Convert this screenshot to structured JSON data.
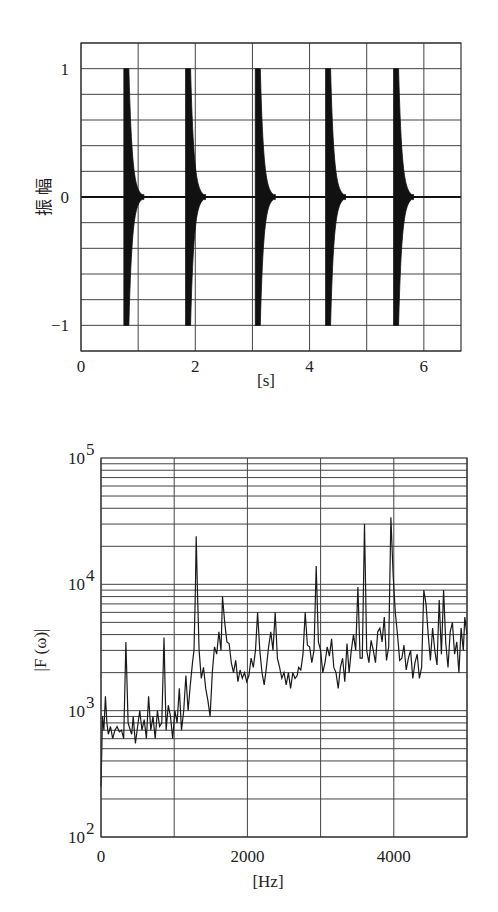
{
  "chart_data": [
    {
      "type": "line",
      "title": "",
      "xlabel": "[s]",
      "ylabel": "振 幅",
      "xlim": [
        0,
        6.65
      ],
      "ylim": [
        -1.2,
        1.2
      ],
      "xticks": [
        0,
        2,
        4,
        6
      ],
      "xtick_labels": [
        "0",
        "2",
        "4",
        "6"
      ],
      "yticks": [
        -1,
        0,
        1
      ],
      "ytick_labels": [
        "−1",
        "0",
        "1"
      ],
      "grid": {
        "x_step": 1,
        "y_step": 0.2
      },
      "description": "Five decaying impulse bursts, each peaking at amplitude ±1 and decaying to ~0 within ~0.35 s",
      "series": [
        {
          "name": "amplitude",
          "bursts": [
            {
              "onset": 0.75,
              "peak": 1.0,
              "decay_s": 0.35
            },
            {
              "onset": 1.83,
              "peak": 1.0,
              "decay_s": 0.35
            },
            {
              "onset": 3.05,
              "peak": 1.0,
              "decay_s": 0.35
            },
            {
              "onset": 4.28,
              "peak": 1.0,
              "decay_s": 0.35
            },
            {
              "onset": 5.47,
              "peak": 1.0,
              "decay_s": 0.35
            }
          ]
        }
      ]
    },
    {
      "type": "line",
      "title": "",
      "xlabel": "[Hz]",
      "ylabel": "|F (ω)|",
      "xlim": [
        0,
        5000
      ],
      "ylim": [
        100,
        100000
      ],
      "yscale": "log",
      "xticks": [
        0,
        2000,
        4000
      ],
      "xtick_labels": [
        "0",
        "2000",
        "4000"
      ],
      "yticks": [
        100,
        1000,
        10000,
        100000
      ],
      "ytick_labels": [
        {
          "base": "10",
          "exp": "2"
        },
        {
          "base": "10",
          "exp": "3"
        },
        {
          "base": "10",
          "exp": "4"
        },
        {
          "base": "10",
          "exp": "5"
        }
      ],
      "grid": {
        "x_step": 1000,
        "y": "log-minor"
      },
      "series": [
        {
          "name": "|F(ω)|",
          "x": [
            0,
            20,
            40,
            60,
            80,
            100,
            130,
            160,
            190,
            220,
            250,
            280,
            310,
            340,
            370,
            400,
            420,
            440,
            470,
            500,
            530,
            560,
            590,
            620,
            650,
            680,
            710,
            740,
            770,
            800,
            830,
            860,
            890,
            920,
            950,
            980,
            1010,
            1040,
            1070,
            1100,
            1130,
            1160,
            1190,
            1220,
            1250,
            1270,
            1290,
            1300,
            1320,
            1340,
            1370,
            1400,
            1430,
            1460,
            1490,
            1520,
            1550,
            1580,
            1610,
            1640,
            1660,
            1690,
            1720,
            1750,
            1780,
            1810,
            1840,
            1870,
            1900,
            1930,
            1960,
            1990,
            2020,
            2050,
            2080,
            2110,
            2140,
            2170,
            2200,
            2230,
            2260,
            2290,
            2320,
            2350,
            2380,
            2410,
            2440,
            2470,
            2500,
            2530,
            2560,
            2590,
            2620,
            2650,
            2680,
            2700,
            2730,
            2760,
            2790,
            2820,
            2850,
            2880,
            2910,
            2940,
            2970,
            3000,
            3030,
            3060,
            3090,
            3120,
            3150,
            3180,
            3210,
            3240,
            3270,
            3300,
            3330,
            3360,
            3390,
            3420,
            3450,
            3480,
            3510,
            3540,
            3570,
            3600,
            3630,
            3660,
            3690,
            3720,
            3750,
            3780,
            3810,
            3840,
            3870,
            3900,
            3930,
            3960,
            3990,
            4020,
            4050,
            4080,
            4110,
            4140,
            4170,
            4200,
            4230,
            4260,
            4290,
            4320,
            4350,
            4380,
            4410,
            4440,
            4470,
            4500,
            4530,
            4560,
            4590,
            4620,
            4650,
            4680,
            4710,
            4740,
            4770,
            4800,
            4830,
            4860,
            4890,
            4920,
            4950,
            4970,
            5000
          ],
          "y": [
            250,
            900,
            700,
            1300,
            800,
            650,
            750,
            600,
            700,
            750,
            680,
            700,
            600,
            3500,
            800,
            700,
            650,
            900,
            550,
            750,
            1000,
            700,
            850,
            600,
            1300,
            700,
            900,
            600,
            1000,
            750,
            800,
            3800,
            700,
            1100,
            900,
            600,
            1000,
            800,
            1500,
            700,
            1000,
            1900,
            1000,
            1600,
            2400,
            3000,
            9000,
            24000,
            8000,
            3000,
            1800,
            2200,
            1500,
            1200,
            900,
            2000,
            3200,
            2800,
            4200,
            3000,
            8000,
            5000,
            3500,
            3400,
            2400,
            2000,
            2500,
            1700,
            2100,
            1800,
            2000,
            1700,
            1900,
            2600,
            2200,
            3000,
            6000,
            3000,
            2000,
            1600,
            2200,
            3200,
            4200,
            3000,
            6000,
            2600,
            2200,
            1800,
            2000,
            1600,
            2000,
            1500,
            2000,
            1800,
            1900,
            2200,
            2100,
            2800,
            6000,
            3300,
            3200,
            2400,
            3000,
            14000,
            3500,
            3000,
            2000,
            2400,
            3200,
            2700,
            3700,
            2200,
            2000,
            1500,
            2200,
            2600,
            1700,
            3400,
            2000,
            3000,
            4000,
            3000,
            9500,
            2600,
            2600,
            30000,
            3000,
            2400,
            3600,
            3000,
            2400,
            4200,
            4500,
            3500,
            5500,
            2500,
            3200,
            34000,
            12000,
            6000,
            4000,
            2500,
            2600,
            3300,
            2100,
            2600,
            3000,
            1800,
            2400,
            2800,
            1800,
            2200,
            9000,
            7000,
            4000,
            2500,
            4500,
            3000,
            2300,
            7500,
            2800,
            9000,
            3400,
            2200,
            4200,
            5000,
            2800,
            3500,
            2000,
            4500,
            3000,
            5500,
            4000,
            3300,
            5000,
            4500,
            16000,
            30000,
            7000
          ]
        }
      ]
    }
  ]
}
